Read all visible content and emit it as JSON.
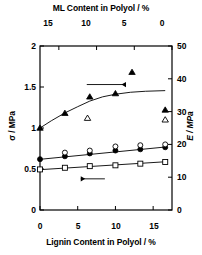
{
  "chart_data": {
    "type": "scatter",
    "title": "",
    "xlabel": "Lignin Content in Polyol / %",
    "xlabel_top": "ML Content in Polyol / %",
    "ylabel": "σ / MPa",
    "ylabel_right": "E / MPa",
    "xlim": [
      0,
      17.5
    ],
    "xlim_top": [
      17.5,
      0
    ],
    "ylim": [
      0,
      2
    ],
    "ylim_right": [
      0,
      50
    ],
    "xticks": [
      0,
      5,
      10,
      15
    ],
    "xticks_top": [
      15,
      10,
      5,
      0
    ],
    "yticks": [
      0,
      0.5,
      1,
      1.5,
      2
    ],
    "yticks_right": [
      0,
      10,
      20,
      30,
      40,
      50
    ],
    "grid": false,
    "legend": "none",
    "annotations": [
      {
        "name": "arrow-to-right-axis",
        "type": "arrow",
        "direction": "right",
        "x_start": 6.2,
        "x_end": 11.4,
        "y": 1.53
      },
      {
        "name": "arrow-to-left-axis",
        "type": "arrow",
        "direction": "left",
        "x_start": 8.6,
        "x_end": 5.4,
        "y": 0.38
      }
    ],
    "series": [
      {
        "name": "Tensile strength σ (filled circle)",
        "marker": "filled-circle",
        "axis": "left",
        "color": "#000000",
        "has_fit_line": true,
        "x": [
          0,
          3.3,
          6.6,
          10,
          13.3,
          16.6
        ],
        "y": [
          0.62,
          0.655,
          0.69,
          0.725,
          0.74,
          0.765
        ]
      },
      {
        "name": "Tensile strength σ (open circle)",
        "marker": "open-circle",
        "axis": "left",
        "color": "#000000",
        "has_fit_line": false,
        "x": [
          3.3,
          6.6,
          10,
          13.3,
          16.6
        ],
        "y": [
          0.7,
          0.725,
          0.775,
          0.79,
          0.8
        ]
      },
      {
        "name": "Elongation σ (open square)",
        "marker": "open-square",
        "axis": "left",
        "color": "#000000",
        "has_fit_line": true,
        "x": [
          0,
          3.3,
          6.6,
          10,
          13.3,
          16.6
        ],
        "y": [
          0.495,
          0.515,
          0.535,
          0.545,
          0.565,
          0.585
        ]
      },
      {
        "name": "Modulus E (filled triangle)",
        "marker": "filled-triangle",
        "axis": "right",
        "color": "#000000",
        "has_fit_line": true,
        "x": [
          0,
          3.3,
          6.6,
          10,
          12.2,
          16.6
        ],
        "y": [
          25.0,
          29.5,
          34.5,
          35.5,
          42.0,
          30.5
        ]
      },
      {
        "name": "Modulus E (open triangle)",
        "marker": "open-triangle",
        "axis": "right",
        "color": "#000000",
        "has_fit_line": false,
        "x": [
          6.3,
          16.6
        ],
        "y": [
          28.0,
          27.5
        ]
      }
    ],
    "fit_curves": [
      {
        "name": "E fit curve",
        "axis": "right",
        "points": [
          [
            0,
            25.0
          ],
          [
            1.5,
            27.2
          ],
          [
            3.3,
            29.6
          ],
          [
            5,
            31.5
          ],
          [
            6.6,
            33.2
          ],
          [
            8.3,
            34.5
          ],
          [
            10,
            35.3
          ],
          [
            12,
            35.9
          ],
          [
            14,
            36.2
          ],
          [
            16.6,
            36.4
          ]
        ]
      },
      {
        "name": "σ filled-circle fit line",
        "axis": "left",
        "points": [
          [
            0,
            0.618
          ],
          [
            16.6,
            0.768
          ]
        ]
      },
      {
        "name": "σ open-square fit line",
        "axis": "left",
        "points": [
          [
            0,
            0.492
          ],
          [
            16.6,
            0.588
          ]
        ]
      }
    ]
  },
  "axes": {
    "top_title": "ML Content in Polyol / %",
    "bottom_title": "Lignin Content in Polyol / %",
    "left_title": "σ / MPa",
    "right_title": "E / MPa",
    "top_ticks": [
      "15",
      "10",
      "5",
      "0"
    ],
    "bottom_ticks": [
      "0",
      "5",
      "10",
      "15"
    ],
    "left_ticks": [
      "2",
      "1.5",
      "1",
      "0.5",
      "0"
    ],
    "right_ticks": [
      "50",
      "40",
      "30",
      "20",
      "10",
      "0"
    ]
  }
}
